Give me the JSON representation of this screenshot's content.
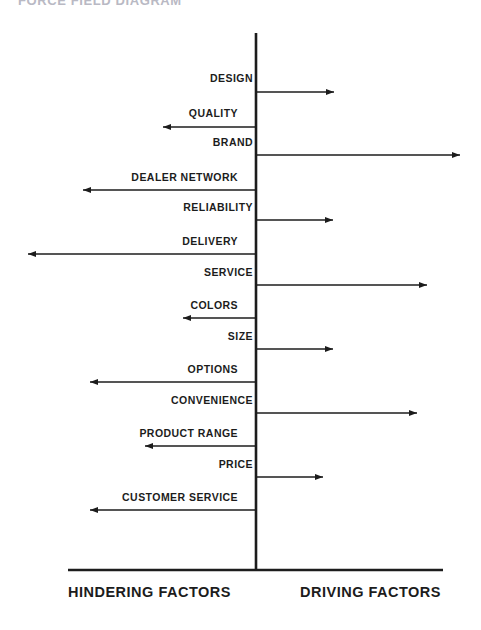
{
  "title": "FORCE FIELD DIAGRAM",
  "axis": {
    "center_x": 256,
    "top_y": 33,
    "bottom_y": 570,
    "baseline_x_start": 68,
    "baseline_x_end": 443,
    "left_caption": "HINDERING FACTORS",
    "right_caption": "DRIVING FACTORS",
    "left_caption_x": 68,
    "right_caption_x": 300,
    "caption_y": 597
  },
  "colors": {
    "ink": "#1c1c1c",
    "title": "#b9b9c4",
    "background": "#ffffff"
  },
  "chart_data": {
    "type": "bar",
    "title": "FORCE FIELD DIAGRAM",
    "xlabel": "",
    "ylabel": "",
    "orientation": "horizontal-diverging",
    "center_value": 0,
    "categories": [
      "DESIGN",
      "QUALITY",
      "BRAND",
      "DEALER NETWORK",
      "RELIABILITY",
      "DELIVERY",
      "SERVICE",
      "COLORS",
      "SIZE",
      "OPTIONS",
      "CONVENIENCE",
      "PRODUCT RANGE",
      "PRICE",
      "CUSTOMER SERVICE"
    ],
    "legend": [
      "HINDERING FACTORS",
      "DRIVING FACTORS"
    ],
    "series": [
      {
        "name": "Force magnitude (px from center, signed)",
        "values": [
          78,
          -93,
          204,
          -173,
          77,
          -228,
          171,
          -73,
          77,
          -166,
          161,
          -111,
          67,
          -166
        ]
      }
    ]
  },
  "factors": [
    {
      "label": "DESIGN",
      "direction": "driving",
      "y": 92,
      "label_y": 82,
      "tip_x": 334,
      "label_x": 253,
      "anchor": "end"
    },
    {
      "label": "QUALITY",
      "direction": "hindering",
      "y": 127,
      "label_y": 117,
      "tip_x": 163,
      "label_x": 238,
      "anchor": "end"
    },
    {
      "label": "BRAND",
      "direction": "driving",
      "y": 155,
      "label_y": 146,
      "tip_x": 460,
      "label_x": 253,
      "anchor": "end"
    },
    {
      "label": "DEALER NETWORK",
      "direction": "hindering",
      "y": 190,
      "label_y": 181,
      "tip_x": 83,
      "label_x": 238,
      "anchor": "end"
    },
    {
      "label": "RELIABILITY",
      "direction": "driving",
      "y": 220,
      "label_y": 211,
      "tip_x": 333,
      "label_x": 253,
      "anchor": "end"
    },
    {
      "label": "DELIVERY",
      "direction": "hindering",
      "y": 254,
      "label_y": 245,
      "tip_x": 28,
      "label_x": 238,
      "anchor": "end"
    },
    {
      "label": "SERVICE",
      "direction": "driving",
      "y": 285,
      "label_y": 276,
      "tip_x": 427,
      "label_x": 253,
      "anchor": "end"
    },
    {
      "label": "COLORS",
      "direction": "hindering",
      "y": 318,
      "label_y": 309,
      "tip_x": 183,
      "label_x": 238,
      "anchor": "end"
    },
    {
      "label": "SIZE",
      "direction": "driving",
      "y": 349,
      "label_y": 340,
      "tip_x": 333,
      "label_x": 253,
      "anchor": "end"
    },
    {
      "label": "OPTIONS",
      "direction": "hindering",
      "y": 382,
      "label_y": 373,
      "tip_x": 90,
      "label_x": 238,
      "anchor": "end"
    },
    {
      "label": "CONVENIENCE",
      "direction": "driving",
      "y": 413,
      "label_y": 404,
      "tip_x": 417,
      "label_x": 253,
      "anchor": "end"
    },
    {
      "label": "PRODUCT RANGE",
      "direction": "hindering",
      "y": 446,
      "label_y": 437,
      "tip_x": 145,
      "label_x": 238,
      "anchor": "end"
    },
    {
      "label": "PRICE",
      "direction": "driving",
      "y": 477,
      "label_y": 468,
      "tip_x": 323,
      "label_x": 253,
      "anchor": "end"
    },
    {
      "label": "CUSTOMER SERVICE",
      "direction": "hindering",
      "y": 510,
      "label_y": 501,
      "tip_x": 90,
      "label_x": 238,
      "anchor": "end"
    }
  ]
}
